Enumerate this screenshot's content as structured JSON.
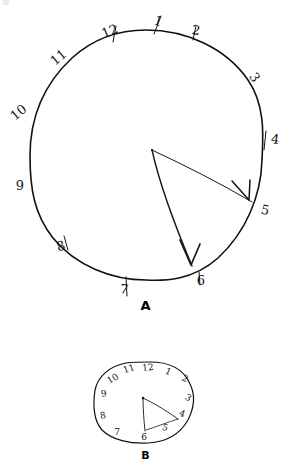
{
  "figure": {
    "background_color": "#ffffff",
    "ink_color": "#141414",
    "panels": [
      {
        "id": "A",
        "label": "A",
        "description": "large hand-drawn clock face with numerals 1-12 written outside the circle and two arrow hands",
        "dial": {
          "center_x": 146,
          "center_y": 155,
          "radius_x": 116,
          "radius_y": 125,
          "stroke_width": 1.6
        },
        "numerals": [
          {
            "value": "12",
            "angle_deg": -75,
            "x": 110,
            "y": 32,
            "rotate": -22,
            "size": 13
          },
          {
            "value": "1",
            "angle_deg": -60,
            "x": 158,
            "y": 22,
            "rotate": 18,
            "size": 13
          },
          {
            "value": "2",
            "angle_deg": -35,
            "x": 196,
            "y": 31,
            "rotate": 10,
            "size": 13
          },
          {
            "value": "3",
            "angle_deg": -10,
            "x": 254,
            "y": 78,
            "rotate": 55,
            "size": 13
          },
          {
            "value": "4",
            "angle_deg": 15,
            "x": 275,
            "y": 140,
            "rotate": 8,
            "size": 13
          },
          {
            "value": "5",
            "angle_deg": 42,
            "x": 265,
            "y": 211,
            "rotate": 12,
            "size": 13
          },
          {
            "value": "6",
            "angle_deg": 72,
            "x": 201,
            "y": 281,
            "rotate": 0,
            "size": 13
          },
          {
            "value": "7",
            "angle_deg": 105,
            "x": 124,
            "y": 290,
            "rotate": 8,
            "size": 13
          },
          {
            "value": "8",
            "angle_deg": 138,
            "x": 61,
            "y": 247,
            "rotate": -18,
            "size": 13
          },
          {
            "value": "9",
            "angle_deg": 168,
            "x": 20,
            "y": 186,
            "rotate": 0,
            "size": 13
          },
          {
            "value": "10",
            "angle_deg": 198,
            "x": 19,
            "y": 113,
            "rotate": -40,
            "size": 13
          },
          {
            "value": "11",
            "angle_deg": 228,
            "x": 59,
            "y": 58,
            "rotate": -40,
            "size": 13
          }
        ],
        "hands": [
          {
            "name": "minute-hand",
            "points_to": "5",
            "origin_x": 152,
            "origin_y": 150,
            "tip_x": 252,
            "tip_y": 202,
            "arrowhead": true,
            "stroke_width": 1.0
          },
          {
            "name": "hour-hand",
            "points_to": "6",
            "origin_x": 152,
            "origin_y": 150,
            "tip_x": 192,
            "tip_y": 266,
            "arrowhead": true,
            "stroke_width": 1.3
          }
        ]
      },
      {
        "id": "B",
        "label": "B",
        "description": "small irregular hand-drawn clock face with crowded numerals and two short hands",
        "dial": {
          "center_x": 143,
          "center_y": 404,
          "radius_x": 47,
          "radius_y": 44,
          "stroke_width": 1.2
        },
        "numerals": [
          {
            "value": "12",
            "x": 148,
            "y": 368,
            "rotate": -6,
            "size": 9
          },
          {
            "value": "11",
            "x": 129,
            "y": 369,
            "rotate": -18,
            "size": 9
          },
          {
            "value": "10",
            "x": 113,
            "y": 379,
            "rotate": -30,
            "size": 9
          },
          {
            "value": "9",
            "x": 104,
            "y": 394,
            "rotate": -10,
            "size": 9
          },
          {
            "value": "8",
            "x": 103,
            "y": 416,
            "rotate": -12,
            "size": 9
          },
          {
            "value": "7",
            "x": 117,
            "y": 432,
            "rotate": 0,
            "size": 9
          },
          {
            "value": "6",
            "x": 144,
            "y": 437,
            "rotate": 0,
            "size": 9
          },
          {
            "value": "5",
            "x": 165,
            "y": 428,
            "rotate": 18,
            "size": 9
          },
          {
            "value": "4",
            "x": 182,
            "y": 414,
            "rotate": 22,
            "size": 9
          },
          {
            "value": "3",
            "x": 188,
            "y": 398,
            "rotate": 30,
            "size": 9
          },
          {
            "value": "2",
            "x": 185,
            "y": 379,
            "rotate": 26,
            "size": 9
          },
          {
            "value": "1",
            "x": 168,
            "y": 372,
            "rotate": 22,
            "size": 9
          }
        ],
        "hands": [
          {
            "name": "minute-hand",
            "points_to": "4",
            "origin_x": 143,
            "origin_y": 398,
            "tip_x": 176,
            "tip_y": 418,
            "arrowhead": false,
            "stroke_width": 0.9
          },
          {
            "name": "hour-hand",
            "points_to": "6",
            "origin_x": 143,
            "origin_y": 398,
            "tip_x": 145,
            "tip_y": 430,
            "arrowhead": false,
            "stroke_width": 0.9
          }
        ]
      }
    ]
  }
}
